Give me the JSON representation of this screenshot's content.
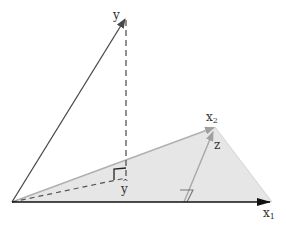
{
  "figure": {
    "labels": {
      "y": "y",
      "y_hat": "y",
      "y_hat_accent": "^",
      "x1_base": "x",
      "x1_sub": "1",
      "x2_base": "x",
      "x2_sub": "2",
      "z": "z"
    },
    "colors": {
      "plane_fill": "#e6e6e6",
      "plane_edge": "#bdbdbd",
      "vector_dark": "#4a4a4a",
      "vector_light": "#a8a8a8",
      "dashed": "#555555",
      "axis": "#1a1a1a",
      "text": "#333333"
    },
    "points": {
      "origin": [
        12,
        202
      ],
      "y_tip": [
        126,
        17
      ],
      "y_hat": [
        126,
        178
      ],
      "x1_tip": [
        270,
        202
      ],
      "x2_tip": [
        215,
        127
      ],
      "plane_right_vertex": [
        272,
        202
      ],
      "z_start": [
        184,
        202
      ],
      "z_tip": [
        214,
        131
      ]
    }
  }
}
